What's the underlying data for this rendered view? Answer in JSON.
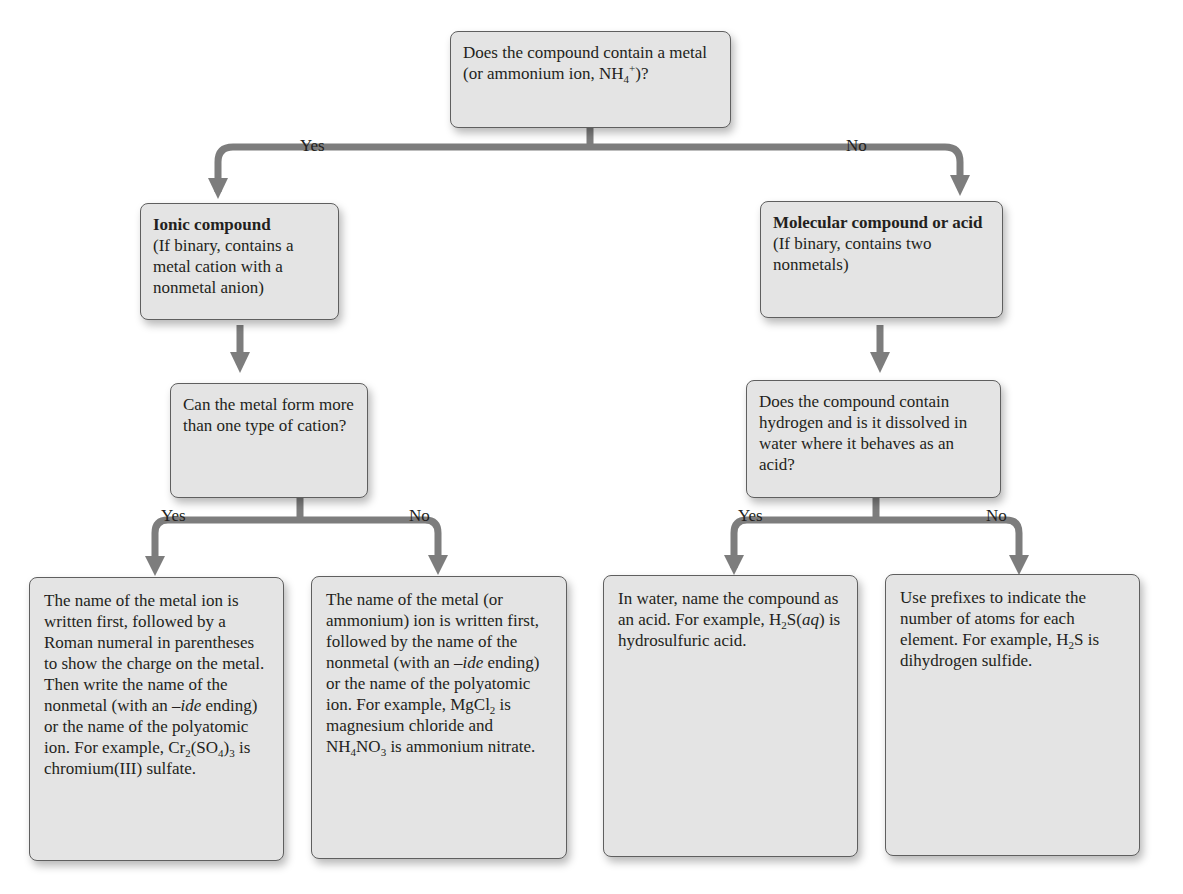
{
  "diagram": {
    "root": {
      "text": "Does the compound contain a metal (or ammonium ion, NH",
      "sub": "4",
      "sup": "+",
      "tail": ")?"
    },
    "branch1": {
      "yes": "Yes",
      "no": "No"
    },
    "ionic": {
      "title": "Ionic compound",
      "desc": "(If binary, contains a metal cation with a nonmetal anion)"
    },
    "molecular": {
      "title": "Molecular compound or acid",
      "desc": "(If binary, contains two nonmetals)"
    },
    "q_metal": {
      "text": "Can the metal form more than one type of cation?"
    },
    "q_acid": {
      "text": "Does the compound contain hydrogen and is it dissolved in water where it behaves as an acid?"
    },
    "branch2": {
      "yes": "Yes",
      "no": "No"
    },
    "branch3": {
      "yes": "Yes",
      "no": "No"
    },
    "leaf1": {
      "p1": "The name of the metal ion is written first, followed by a Roman numeral in parentheses to show the charge on the metal. Then write the name of the nonmetal (with an ",
      "ide": "–ide",
      "p2": " ending) or the name of the polyatomic ion. For example, Cr",
      "s1": "2",
      "p3": "(SO",
      "s2": "4",
      "p4": ")",
      "s3": "3",
      "p5": " is chromium(III) sulfate."
    },
    "leaf2": {
      "p1": "The name of the metal (or ammonium) ion is written first, followed by the name of the nonmetal (with an ",
      "ide": "–ide",
      "p2": " ending) or the name of the polyatomic ion. For example, MgCl",
      "s1": "2",
      "p3": " is magnesium chloride and NH",
      "s2": "4",
      "p4": "NO",
      "s3": "3",
      "p5": " is ammonium nitrate."
    },
    "leaf3": {
      "p1": "In water, name the compound as an acid. For example, H",
      "s1": "2",
      "p2": "S(",
      "aq": "aq",
      "p3": ") is hydrosulfuric acid."
    },
    "leaf4": {
      "p1": "Use prefixes to indicate the number of atoms for each element. For example, H",
      "s1": "2",
      "p2": "S is dihydrogen sulfide."
    },
    "colors": {
      "box_fill": "#e4e4e4",
      "box_border": "#5f5f5f",
      "connector": "#7a7a7a"
    }
  }
}
